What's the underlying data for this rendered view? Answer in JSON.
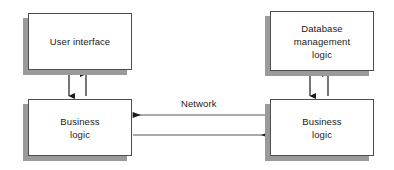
{
  "diagram": {
    "style": {
      "box_fill": "#ffffff",
      "box_border": "#4d4d4d",
      "shadow": "#9a9a9a",
      "arrow": "#1a1a1a",
      "text": "#1a1a1a",
      "background": "#ffffff"
    },
    "nodes": [
      {
        "id": "user-interface",
        "label": "User interface",
        "x": 28,
        "y": 13,
        "w": 104,
        "h": 57
      },
      {
        "id": "database-management-logic",
        "label": "Database\nmanagement\nlogic",
        "x": 270,
        "y": 11,
        "w": 104,
        "h": 60
      },
      {
        "id": "business-logic-client",
        "label": "Business\nlogic",
        "x": 28,
        "y": 99,
        "w": 104,
        "h": 57
      },
      {
        "id": "business-logic-server",
        "label": "Business\nlogic",
        "x": 270,
        "y": 99,
        "w": 104,
        "h": 57
      }
    ],
    "edges": [
      {
        "id": "ui-to-business-down",
        "from": "user-interface",
        "to": "business-logic-client",
        "orientation": "vertical",
        "direction": "down",
        "label": ""
      },
      {
        "id": "business-to-ui-up",
        "from": "business-logic-client",
        "to": "user-interface",
        "orientation": "vertical",
        "direction": "up",
        "label": ""
      },
      {
        "id": "dbml-to-business-down",
        "from": "database-management-logic",
        "to": "business-logic-server",
        "orientation": "vertical",
        "direction": "down",
        "label": ""
      },
      {
        "id": "business-to-dbml-up",
        "from": "business-logic-server",
        "to": "database-management-logic",
        "orientation": "vertical",
        "direction": "up",
        "label": ""
      },
      {
        "id": "server-to-client-network",
        "from": "business-logic-server",
        "to": "business-logic-client",
        "orientation": "horizontal",
        "direction": "left",
        "label": "Network"
      },
      {
        "id": "client-to-server-network",
        "from": "business-logic-client",
        "to": "business-logic-server",
        "orientation": "horizontal",
        "direction": "right",
        "label": ""
      }
    ],
    "labels": {
      "network": "Network"
    }
  }
}
